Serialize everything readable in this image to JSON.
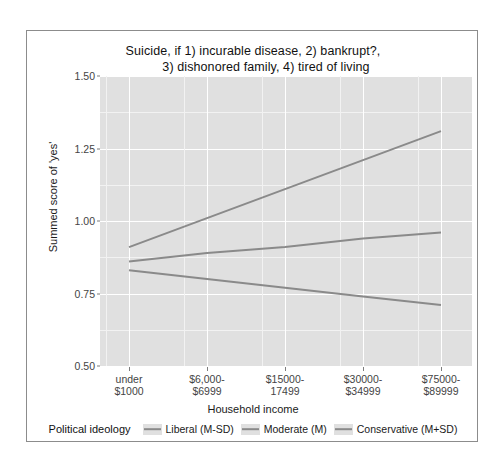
{
  "chart_data": {
    "type": "line",
    "title": "Suicide, if 1) incurable disease, 2) bankrupt?, 3) dishonored family, 4) tired of living",
    "title_line1": "Suicide, if 1) incurable disease, 2) bankrupt?,",
    "title_line2": "3) dishonored family, 4) tired of living",
    "xlabel": "Household income",
    "ylabel": "Summed score of 'yes'",
    "ylim": [
      0.5,
      1.5
    ],
    "yticks": [
      "0.50",
      "0.75",
      "1.00",
      "1.25",
      "1.50"
    ],
    "ytick_values": [
      0.5,
      0.75,
      1.0,
      1.25,
      1.5
    ],
    "grid": true,
    "legend_position": "bottom",
    "legend_title": "Political ideology",
    "categories": [
      "under $1000",
      "$6,000-$6999",
      "$15000-17499",
      "$30000-$34999",
      "$75000-$89999"
    ],
    "xtick_labels": [
      {
        "line1": "under",
        "line2": "$1000"
      },
      {
        "line1": "$6,000-",
        "line2": "$6999"
      },
      {
        "line1": "$15000-",
        "line2": "17499"
      },
      {
        "line1": "$30000-",
        "line2": "$34999"
      },
      {
        "line1": "$75000-",
        "line2": "$89999"
      }
    ],
    "series": [
      {
        "name": "Liberal (M-SD)",
        "color": "#8a8a8a",
        "values": [
          0.83,
          0.8,
          0.77,
          0.74,
          0.71
        ]
      },
      {
        "name": "Moderate (M)",
        "color": "#8a8a8a",
        "values": [
          0.86,
          0.89,
          0.91,
          0.94,
          0.96
        ]
      },
      {
        "name": "Conservative (M+SD)",
        "color": "#8a8a8a",
        "values": [
          0.91,
          1.01,
          1.11,
          1.21,
          1.31
        ]
      }
    ],
    "panel_background": "#e0e0e0",
    "gridline_color": "#ffffff",
    "line_color": "#8a8a8a"
  }
}
